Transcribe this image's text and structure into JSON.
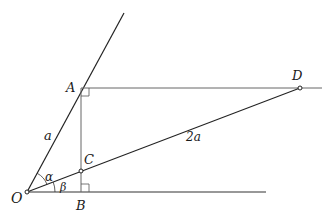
{
  "diagram": {
    "type": "geometry",
    "points": {
      "O": {
        "label": "O",
        "x": 27,
        "y": 192
      },
      "A": {
        "label": "A",
        "x": 81,
        "y": 88
      },
      "B": {
        "label": "B",
        "x": 81,
        "y": 192
      },
      "C": {
        "label": "C",
        "x": 81,
        "y": 170
      },
      "D": {
        "label": "D",
        "x": 300,
        "y": 88
      }
    },
    "segment_labels": {
      "OA": "a",
      "CD": "2a"
    },
    "angle_labels": {
      "alpha": "α",
      "beta": "β"
    },
    "right_angles": [
      "A",
      "B"
    ],
    "colors": {
      "line": "#222222",
      "light_line": "#777777"
    }
  }
}
